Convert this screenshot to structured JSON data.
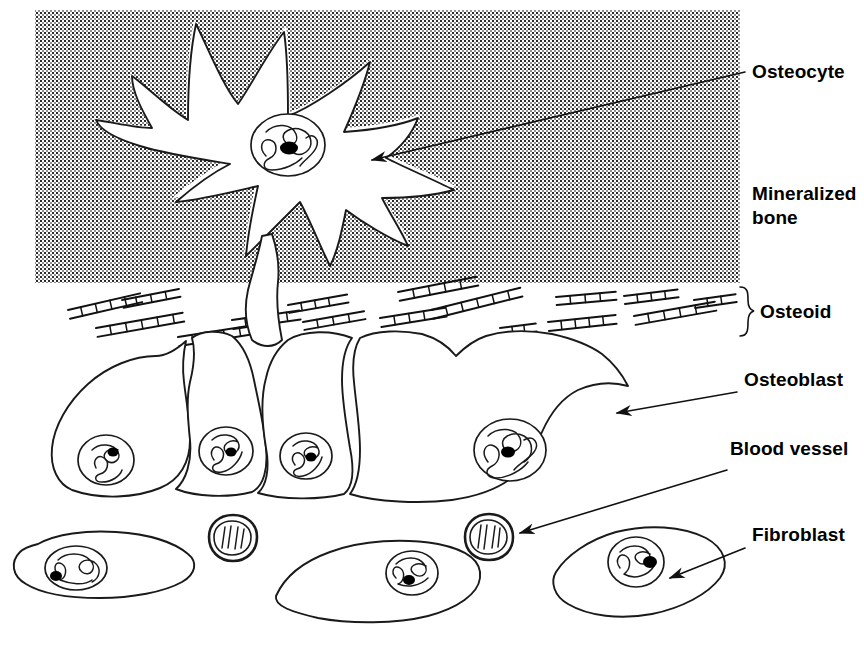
{
  "figure": {
    "background_color": "#ffffff",
    "ink_color": "#111111"
  },
  "regions": {
    "mineralized_bone": {
      "name": "Mineralized bone",
      "fill_pattern": "fine-checkerboard-halftone",
      "x": 35,
      "y": 10,
      "width": 705,
      "height": 273
    },
    "osteoid": {
      "name": "Osteoid",
      "x": 35,
      "y": 283,
      "width": 705,
      "height": 52
    }
  },
  "labels": [
    {
      "id": "osteocyte",
      "text": "Osteocyte",
      "x": 752,
      "y": 78,
      "lines": [
        "Osteocyte"
      ]
    },
    {
      "id": "mineralized-bone",
      "text": "Mineralized bone",
      "x": 752,
      "y": 200,
      "lines": [
        "Mineralized",
        "bone"
      ]
    },
    {
      "id": "osteoid",
      "text": "Osteoid",
      "x": 752,
      "y": 315,
      "lines": [
        "Osteoid"
      ]
    },
    {
      "id": "osteoblast",
      "text": "Osteoblast",
      "x": 744,
      "y": 386,
      "lines": [
        "Osteoblast"
      ]
    },
    {
      "id": "blood-vessel",
      "text": "Blood vessel",
      "x": 730,
      "y": 455,
      "lines": [
        "Blood vessel"
      ]
    },
    {
      "id": "fibroblast",
      "text": "Fibroblast",
      "x": 752,
      "y": 541,
      "lines": [
        "Fibroblast"
      ]
    }
  ],
  "leaders": [
    {
      "id": "osteocyte-leader",
      "from": [
        745,
        72
      ],
      "to": [
        370,
        160
      ],
      "arrow": true
    },
    {
      "id": "osteoblast-leader",
      "from": [
        737,
        392
      ],
      "to": [
        615,
        413
      ],
      "arrow": true
    },
    {
      "id": "blood-vessel-leader",
      "from": [
        727,
        470
      ],
      "to": [
        518,
        533
      ],
      "arrow": true
    },
    {
      "id": "fibroblast-leader",
      "from": [
        745,
        548
      ],
      "to": [
        668,
        578
      ],
      "arrow": true
    }
  ],
  "cells": {
    "osteocyte": {
      "name": "Osteocyte",
      "count": 1,
      "description": "stellate cell with dendritic processes inside a white lacuna in mineralized bone",
      "center": [
        290,
        150
      ]
    },
    "osteoblasts": {
      "name": "Osteoblast",
      "count": 4,
      "description": "row of cuboidal cells lining the osteoid surface, each with a basal nucleus",
      "centers": [
        [
          120,
          420
        ],
        [
          240,
          420
        ],
        [
          370,
          425
        ],
        [
          515,
          420
        ]
      ]
    },
    "fibroblasts": {
      "name": "Fibroblast",
      "count": 3,
      "description": "elongated flattened cells in the connective tissue below",
      "centers": [
        [
          100,
          570
        ],
        [
          385,
          582
        ],
        [
          640,
          570
        ]
      ]
    },
    "blood_vessels": {
      "name": "Blood vessel",
      "count": 2,
      "description": "small vessels in cross section with thick wall and cells in lumen",
      "centers": [
        [
          233,
          538
        ],
        [
          489,
          537
        ]
      ]
    }
  }
}
